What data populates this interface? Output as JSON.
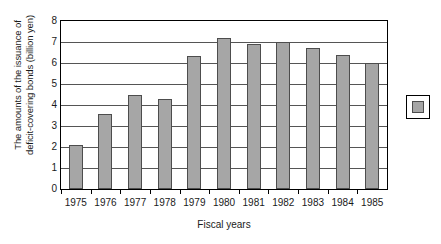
{
  "chart_data": {
    "type": "bar",
    "title": "",
    "xlabel": "Fiscal years",
    "ylabel": "The amounts of the issuance of deficit-covering bonds (billion yen)",
    "ylabel_line1": "The amounts of the issuance of",
    "ylabel_line2": "deficit-covering bonds (billion yen)",
    "categories": [
      "1975",
      "1976",
      "1977",
      "1978",
      "1979",
      "1980",
      "1981",
      "1982",
      "1983",
      "1984",
      "1985"
    ],
    "values": [
      2.1,
      3.55,
      4.5,
      4.3,
      6.35,
      7.2,
      6.9,
      7.0,
      6.7,
      6.4,
      6.0
    ],
    "ylim": [
      0,
      8
    ],
    "ytick_labels": [
      "8",
      "7",
      "6",
      "5",
      "4",
      "3",
      "2",
      "1",
      "0"
    ],
    "ytick_values": [
      8,
      7,
      6,
      5,
      4,
      3,
      2,
      1,
      0
    ],
    "grid": true,
    "legend_position": "right",
    "legend_entries": [
      {
        "label": "",
        "color": "#a6a6a6"
      }
    ],
    "series_color": "#a6a6a6",
    "series_border_color": "#4d4d4d",
    "background": "#ffffff"
  }
}
